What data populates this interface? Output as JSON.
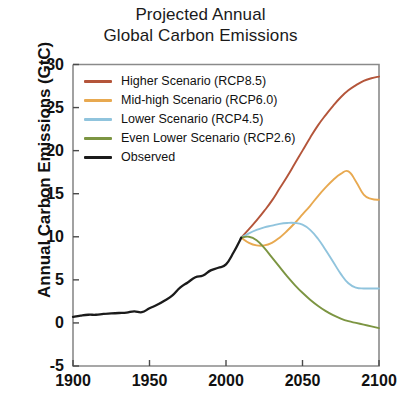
{
  "chart_data": {
    "type": "line",
    "title": "Projected Annual Global Carbon Emissions",
    "title_lines": [
      "Projected Annual",
      "Global Carbon Emissions"
    ],
    "xlabel": "",
    "ylabel": "Annual Carbon Emissions (GtC)",
    "xlim": [
      1900,
      2100
    ],
    "ylim": [
      -5,
      30
    ],
    "xticks": [
      1900,
      1950,
      2000,
      2050,
      2100
    ],
    "xtick_labels": [
      "1900",
      "1950",
      "2000",
      "2050",
      "2100"
    ],
    "yticks": [
      -5,
      0,
      5,
      10,
      15,
      20,
      25,
      30
    ],
    "ytick_labels": [
      "-5",
      "0",
      "5",
      "10",
      "15",
      "20",
      "25",
      "30"
    ],
    "grid": false,
    "legend_position": "upper left",
    "series": [
      {
        "name": "Higher Scenario (RCP8.5)",
        "color": "#b4553a",
        "x": [
          2010,
          2015,
          2020,
          2025,
          2030,
          2035,
          2040,
          2045,
          2050,
          2055,
          2060,
          2065,
          2070,
          2075,
          2080,
          2085,
          2090,
          2095,
          2100
        ],
        "values": [
          9.9,
          10.9,
          11.9,
          13.0,
          14.2,
          15.6,
          17.0,
          18.5,
          20.0,
          21.5,
          22.9,
          24.1,
          25.2,
          26.2,
          27.0,
          27.6,
          28.1,
          28.4,
          28.6
        ]
      },
      {
        "name": "Mid-high Scenario (RCP6.0)",
        "color": "#e8a950",
        "x": [
          2010,
          2015,
          2020,
          2025,
          2030,
          2035,
          2040,
          2045,
          2050,
          2055,
          2060,
          2065,
          2070,
          2075,
          2080,
          2085,
          2090,
          2095,
          2100
        ],
        "values": [
          9.9,
          9.3,
          9.0,
          9.0,
          9.3,
          9.9,
          10.7,
          11.6,
          12.6,
          13.6,
          14.7,
          15.7,
          16.6,
          17.3,
          17.6,
          16.4,
          14.9,
          14.4,
          14.3
        ]
      },
      {
        "name": "Lower Scenario (RCP4.5)",
        "color": "#90c4dd",
        "x": [
          2010,
          2015,
          2020,
          2025,
          2030,
          2035,
          2040,
          2045,
          2050,
          2055,
          2060,
          2065,
          2070,
          2075,
          2080,
          2085,
          2090,
          2095,
          2100
        ],
        "values": [
          9.9,
          10.4,
          10.8,
          11.1,
          11.3,
          11.5,
          11.6,
          11.6,
          11.4,
          10.8,
          9.8,
          8.5,
          7.1,
          5.7,
          4.6,
          4.1,
          4.0,
          4.0,
          4.0
        ]
      },
      {
        "name": "Even Lower Scenario (RCP2.6)",
        "color": "#7c9542",
        "x": [
          2010,
          2015,
          2020,
          2025,
          2030,
          2035,
          2040,
          2045,
          2050,
          2055,
          2060,
          2065,
          2070,
          2075,
          2080,
          2085,
          2090,
          2095,
          2100
        ],
        "values": [
          9.9,
          10.0,
          9.6,
          8.7,
          7.6,
          6.5,
          5.4,
          4.4,
          3.5,
          2.7,
          2.0,
          1.4,
          0.9,
          0.5,
          0.2,
          0.0,
          -0.2,
          -0.4,
          -0.6
        ]
      },
      {
        "name": "Observed",
        "color": "#1b1b1b",
        "x": [
          1900,
          1905,
          1910,
          1915,
          1920,
          1925,
          1930,
          1935,
          1940,
          1945,
          1950,
          1955,
          1960,
          1965,
          1970,
          1975,
          1980,
          1985,
          1990,
          1995,
          2000,
          2005,
          2010
        ],
        "values": [
          0.7,
          0.85,
          0.95,
          0.95,
          1.05,
          1.1,
          1.15,
          1.2,
          1.35,
          1.25,
          1.7,
          2.1,
          2.6,
          3.2,
          4.1,
          4.7,
          5.3,
          5.5,
          6.1,
          6.4,
          6.8,
          8.2,
          9.9
        ]
      }
    ]
  },
  "legend": {
    "items": [
      {
        "label": "Higher Scenario (RCP8.5)",
        "color": "#b4553a"
      },
      {
        "label": "Mid-high Scenario (RCP6.0)",
        "color": "#e8a950"
      },
      {
        "label": "Lower Scenario (RCP4.5)",
        "color": "#90c4dd"
      },
      {
        "label": "Even Lower Scenario (RCP2.6)",
        "color": "#7c9542"
      },
      {
        "label": "Observed",
        "color": "#1b1b1b"
      }
    ]
  }
}
